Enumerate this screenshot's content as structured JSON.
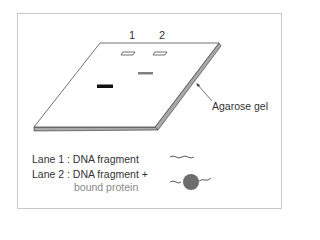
{
  "figure": {
    "lanes": [
      {
        "label": "1"
      },
      {
        "label": "2"
      }
    ],
    "gel_label": "Agarose gel",
    "legend": [
      {
        "text": "Lane 1 : DNA fragment",
        "symbol": "wavy-line"
      },
      {
        "text": "Lane 2 : DNA fragment +",
        "subtext": "bound protein",
        "symbol": "wavy-line-with-circle"
      }
    ],
    "colors": {
      "gel_surface": "#ffffff",
      "gel_edge": "#a9a9a9",
      "outline": "#333333",
      "band_free_dna": "#111111",
      "band_bound": "#808080",
      "protein": "#6d6d6d",
      "subtext": "#888888"
    }
  }
}
